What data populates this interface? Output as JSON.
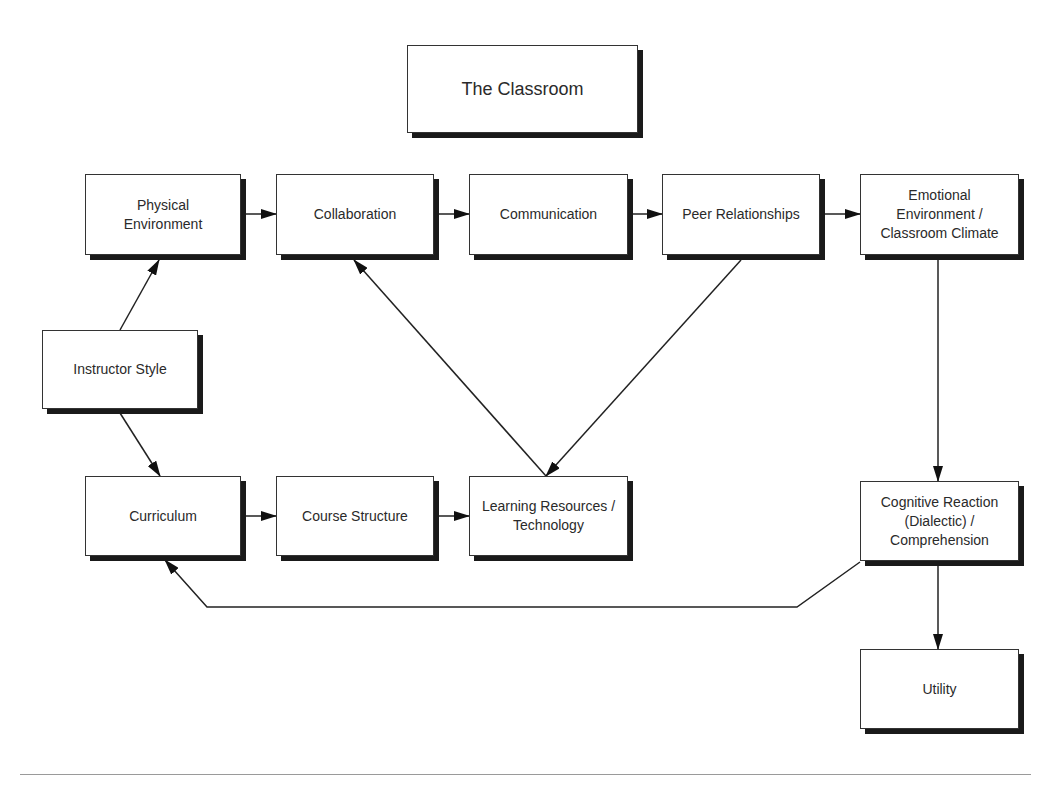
{
  "diagram": {
    "title": "The Classroom",
    "nodes": {
      "title": {
        "label": "The Classroom"
      },
      "physical_environment": {
        "label": "Physical\nEnvironment"
      },
      "collaboration": {
        "label": "Collaboration"
      },
      "communication": {
        "label": "Communication"
      },
      "peer_relationships": {
        "label": "Peer Relationships"
      },
      "emotional_environment": {
        "label": "Emotional\nEnvironment /\nClassroom Climate"
      },
      "instructor_style": {
        "label": "Instructor Style"
      },
      "curriculum": {
        "label": "Curriculum"
      },
      "course_structure": {
        "label": "Course Structure"
      },
      "learning_resources": {
        "label": "Learning Resources /\nTechnology"
      },
      "cognitive_reaction": {
        "label": "Cognitive Reaction\n(Dialectic) /\nComprehension"
      },
      "utility": {
        "label": "Utility"
      }
    },
    "edges": [
      {
        "from": "Physical Environment",
        "to": "Collaboration"
      },
      {
        "from": "Collaboration",
        "to": "Communication"
      },
      {
        "from": "Communication",
        "to": "Peer Relationships"
      },
      {
        "from": "Peer Relationships",
        "to": "Emotional Environment / Classroom Climate"
      },
      {
        "from": "Instructor Style",
        "to": "Physical Environment"
      },
      {
        "from": "Instructor Style",
        "to": "Curriculum"
      },
      {
        "from": "Curriculum",
        "to": "Course Structure"
      },
      {
        "from": "Course Structure",
        "to": "Learning Resources / Technology"
      },
      {
        "from": "Learning Resources / Technology",
        "to": "Collaboration"
      },
      {
        "from": "Peer Relationships",
        "to": "Learning Resources / Technology"
      },
      {
        "from": "Emotional Environment / Classroom Climate",
        "to": "Cognitive Reaction (Dialectic) / Comprehension"
      },
      {
        "from": "Cognitive Reaction (Dialectic) / Comprehension",
        "to": "Utility"
      },
      {
        "from": "Cognitive Reaction (Dialectic) / Comprehension",
        "to": "Curriculum"
      }
    ],
    "colors": {
      "stroke": "#222222",
      "shadow": "#1a1a1a",
      "rule": "#9a9a9a",
      "background": "#ffffff"
    }
  }
}
